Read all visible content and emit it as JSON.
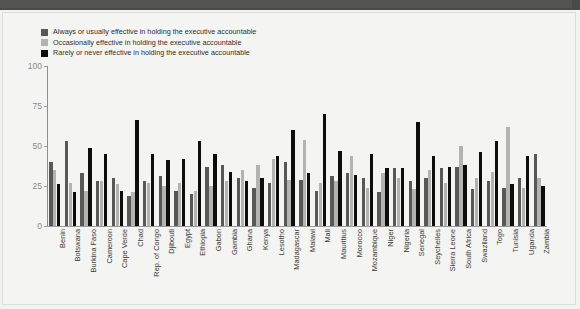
{
  "header": {
    "bar_color": "#4a4a4a"
  },
  "legend": {
    "position": "top-left",
    "entries": [
      {
        "label": "Always or usually effective in holding the executive accountable",
        "color": "#585856",
        "icon": "legend-swatch"
      },
      {
        "label": "Occasionally effective in holding the executive accountable",
        "color": "#b3b3b1",
        "icon": "legend-swatch"
      },
      {
        "label": "Rarely or never effective in holding the executive accountable",
        "color": "#0d0d0d",
        "icon": "legend-swatch"
      }
    ]
  },
  "axes": {
    "y_ticks": [
      "0",
      "25",
      "50",
      "75",
      "100"
    ],
    "y_tick_values": [
      0,
      25,
      50,
      75,
      100
    ]
  },
  "chart_data": {
    "type": "bar",
    "title": "",
    "subtitle": "",
    "xlabel": "",
    "ylabel": "",
    "ylim": [
      0,
      100
    ],
    "grid": false,
    "legend_position": "top-left",
    "orientation": "vertical",
    "grouping": "grouped",
    "categories": [
      "Benin",
      "Botswana",
      "Burkina Faso",
      "Cameroon",
      "Cape Verde",
      "Chad",
      "Rep. of Congo",
      "Djibouti",
      "Egypt",
      "Ethiopia",
      "Gabon",
      "Gambia",
      "Ghana",
      "Kenya",
      "Lesotho",
      "Madagascar",
      "Malawi",
      "Mali",
      "Mauritius",
      "Morocco",
      "Mozambique",
      "Niger",
      "Nigeria",
      "Senegal",
      "Seychelles",
      "Sierra Leone",
      "South Africa",
      "Swaziland",
      "Togo",
      "Tunisia",
      "Uganda",
      "Zambia"
    ],
    "series": [
      {
        "name": "Always or usually effective in holding the executive accountable",
        "color": "#585856",
        "values": [
          40,
          53,
          33,
          28,
          30,
          19,
          28,
          31,
          22,
          20,
          37,
          38,
          30,
          24,
          27,
          40,
          29,
          22,
          31,
          33,
          30,
          21,
          36,
          28,
          30,
          36,
          37,
          23,
          28,
          24,
          30,
          45
        ]
      },
      {
        "name": "Occasionally effective in holding the executive accountable",
        "color": "#b3b3b1",
        "values": [
          35,
          27,
          22,
          28,
          26,
          21,
          27,
          25,
          27,
          22,
          25,
          28,
          35,
          38,
          42,
          29,
          54,
          27,
          28,
          44,
          24,
          33,
          30,
          23,
          35,
          27,
          50,
          30,
          34,
          62,
          24,
          30
        ]
      },
      {
        "name": "Rarely or never effective in holding the executive accountable",
        "color": "#0d0d0d",
        "values": [
          26,
          21,
          49,
          45,
          22,
          66,
          45,
          41,
          42,
          53,
          45,
          34,
          28,
          30,
          44,
          60,
          33,
          70,
          47,
          32,
          45,
          36,
          36,
          65,
          44,
          37,
          38,
          46,
          53,
          26,
          44,
          25
        ]
      }
    ]
  }
}
